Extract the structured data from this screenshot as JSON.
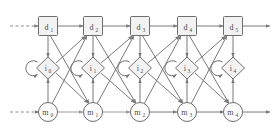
{
  "diagram": {
    "type": "dynamic-bayesian-network-trellis",
    "background_color": "#ffffff",
    "node_fill": "#f2f2f2",
    "stroke_color": "#7a7a7a",
    "rows": [
      {
        "id": "d-row",
        "shape": "square",
        "y": 26,
        "nodes": [
          {
            "label": "d",
            "sub": "1",
            "x": 48
          },
          {
            "label": "d",
            "sub": "2",
            "x": 93
          },
          {
            "label": "d",
            "sub": "3",
            "x": 140
          },
          {
            "label": "d",
            "sub": "4",
            "x": 187
          },
          {
            "label": "d",
            "sub": "5",
            "x": 233
          }
        ]
      },
      {
        "id": "i-row",
        "shape": "diamond",
        "y": 68,
        "self_loop": true,
        "nodes": [
          {
            "label": "i",
            "sub": "0",
            "x": 48
          },
          {
            "label": "i",
            "sub": "1",
            "x": 93
          },
          {
            "label": "i",
            "sub": "2",
            "x": 140
          },
          {
            "label": "i",
            "sub": "3",
            "x": 187
          },
          {
            "label": "i",
            "sub": "4",
            "x": 233
          }
        ]
      },
      {
        "id": "m-row",
        "shape": "circle",
        "y": 112,
        "nodes": [
          {
            "label": "m",
            "sub": "0",
            "x": 48
          },
          {
            "label": "m",
            "sub": "1",
            "x": 93
          },
          {
            "label": "m",
            "sub": "2",
            "x": 140
          },
          {
            "label": "m",
            "sub": "3",
            "x": 187
          },
          {
            "label": "m",
            "sub": "4",
            "x": 233
          }
        ]
      }
    ],
    "entry_edges": {
      "style": "dashed",
      "count": 2
    },
    "exit_edges": {
      "style": "solid",
      "count": 2
    }
  }
}
